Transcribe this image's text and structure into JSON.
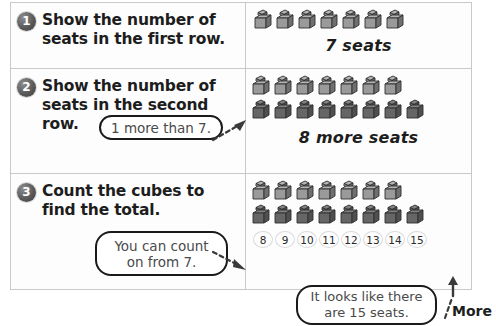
{
  "worksheet": {
    "steps": [
      {
        "number": "1",
        "instruction": "Show the number of seats in the first row.",
        "caption": "7 seats",
        "cube_rows": [
          7
        ]
      },
      {
        "number": "2",
        "instruction": "Show the number of seats in the second row.",
        "caption": "8 more seats",
        "cube_rows": [
          7,
          8
        ],
        "bubble": "1 more than 7."
      },
      {
        "number": "3",
        "instruction": "Count the cubes to find the total.",
        "cube_rows": [
          7,
          8
        ],
        "bubble": "You can count on from 7.",
        "count_labels": [
          "8",
          "9",
          "10",
          "11",
          "12",
          "13",
          "14",
          "15"
        ]
      }
    ],
    "total_bubble": "It looks like there are 15 seats.",
    "more_label": "More"
  },
  "colors": {
    "border": "#c9c9c9",
    "bubble_outline": "#1a1a1a",
    "bubble_text": "#4a4a4a",
    "badge": "#5a5a5a",
    "cube_light": "#a6a6a6",
    "cube_dark": "#6e6e6e",
    "text": "#1d1d1d"
  }
}
